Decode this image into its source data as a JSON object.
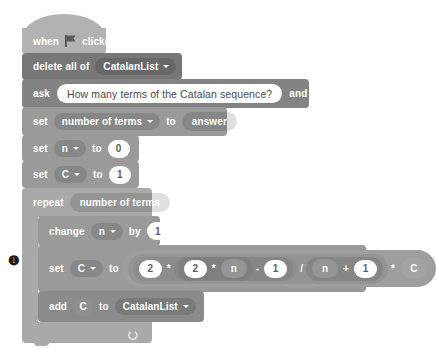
{
  "script": {
    "title": "Catalan sequence script",
    "blocks": [
      {
        "id": "when-flag-clicked",
        "type": "hat",
        "label_before": "when",
        "icon": "green-flag-icon",
        "label_after": "clicked"
      },
      {
        "id": "delete-all-of",
        "type": "stack",
        "label": "delete all of",
        "dropdown": "CatalanList"
      },
      {
        "id": "ask-and-wait",
        "type": "stack",
        "label_before": "ask",
        "prompt": "How many terms of the Catalan sequence?",
        "label_after": "and wait"
      },
      {
        "id": "set-number-of-terms",
        "type": "stack",
        "label_before": "set",
        "dropdown": "number of terms",
        "label_mid": "to",
        "value_reporter": "answer"
      },
      {
        "id": "set-n",
        "type": "stack",
        "label_before": "set",
        "dropdown": "n",
        "label_mid": "to",
        "value": "0"
      },
      {
        "id": "set-c",
        "type": "stack",
        "label_before": "set",
        "dropdown": "C",
        "label_mid": "to",
        "value": "1"
      },
      {
        "id": "repeat",
        "type": "c-block",
        "label": "repeat",
        "times_reporter": "number of terms",
        "loop_icon": "loop-arrow-icon",
        "body": [
          {
            "id": "change-n-by",
            "type": "stack",
            "label_before": "change",
            "dropdown": "n",
            "label_mid": "by",
            "value": "1"
          },
          {
            "id": "set-c-formula",
            "type": "stack",
            "label_before": "set",
            "dropdown": "C",
            "label_mid": "to",
            "formula": {
              "expression": "2 * (2 * n - 1) / (n + 1) * C",
              "tokens": [
                {
                  "kind": "number",
                  "text": "2"
                },
                {
                  "kind": "operator",
                  "text": "*"
                },
                {
                  "kind": "number",
                  "text": "2"
                },
                {
                  "kind": "operator",
                  "text": "*"
                },
                {
                  "kind": "variable",
                  "text": "n"
                },
                {
                  "kind": "operator",
                  "text": "-"
                },
                {
                  "kind": "number",
                  "text": "1"
                },
                {
                  "kind": "operator",
                  "text": "/"
                },
                {
                  "kind": "variable",
                  "text": "n"
                },
                {
                  "kind": "operator",
                  "text": "+"
                },
                {
                  "kind": "number",
                  "text": "1"
                },
                {
                  "kind": "operator",
                  "text": "*"
                },
                {
                  "kind": "variable",
                  "text": "C"
                }
              ]
            }
          },
          {
            "id": "add-to-list",
            "type": "stack",
            "label_before": "add",
            "value_reporter": "C",
            "label_mid": "to",
            "dropdown": "CatalanList"
          }
        ]
      }
    ]
  },
  "marker": {
    "glyph": "❶",
    "label": "step-marker"
  },
  "colors": {
    "events": "#b2b2b2",
    "list_dark": "#777777",
    "sensing": "#838383",
    "variables": "#9a9a9a",
    "control": "#a9a9a9",
    "list_mid": "#8b8b8b",
    "operator": "#9e9e9e",
    "canvas": "#ffffff",
    "field_text": "#5c5c5c"
  }
}
